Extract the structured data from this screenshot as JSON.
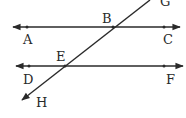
{
  "diagram": {
    "type": "parallel-lines-transversal",
    "colors": {
      "stroke": "#2a2a2a",
      "background": "#ffffff"
    },
    "lines": [
      {
        "name": "AC",
        "from": [
          13,
          27
        ],
        "to": [
          180,
          27
        ],
        "arrows": "both"
      },
      {
        "name": "DF",
        "from": [
          16,
          66
        ],
        "to": [
          183,
          66
        ],
        "arrows": "both"
      },
      {
        "name": "GH",
        "from": [
          150,
          0
        ],
        "to": [
          22,
          100
        ],
        "arrows": "end-H"
      }
    ],
    "labels": {
      "G": "G",
      "B": "B",
      "A": "A",
      "C": "C",
      "E": "E",
      "D": "D",
      "F": "F",
      "H": "H"
    },
    "points": [
      {
        "name": "A",
        "x": 27,
        "y": 27
      },
      {
        "name": "C",
        "x": 164,
        "y": 27
      },
      {
        "name": "B",
        "x": 113,
        "y": 27
      },
      {
        "name": "D",
        "x": 29,
        "y": 66
      },
      {
        "name": "F",
        "x": 164,
        "y": 66
      },
      {
        "name": "E",
        "x": 65,
        "y": 66
      }
    ]
  }
}
